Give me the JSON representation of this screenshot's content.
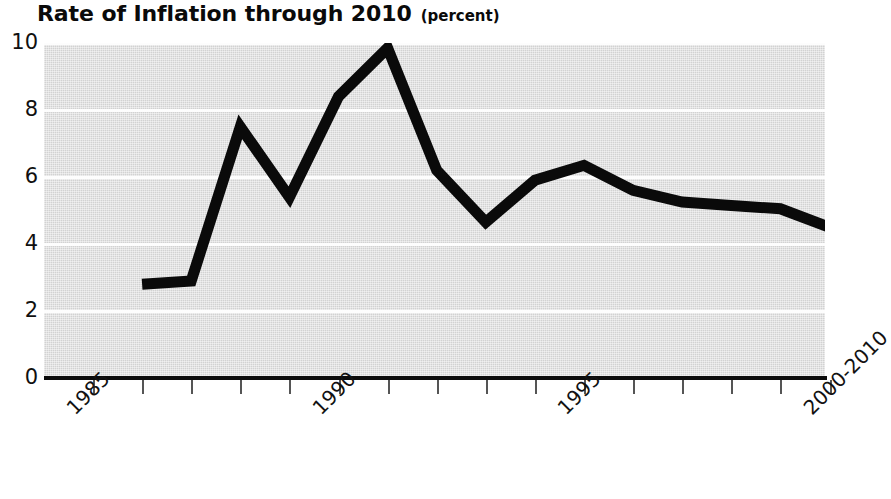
{
  "chart_data": {
    "type": "line",
    "title": "Rate of Inflation through 2010",
    "title_unit": "(percent)",
    "xlabel": "",
    "ylabel": "",
    "ylim": [
      0,
      10
    ],
    "yticks": [
      0,
      2,
      4,
      6,
      8,
      10
    ],
    "ytick_labels": [
      "0",
      "2",
      "4",
      "6",
      "8",
      "10"
    ],
    "grid": true,
    "grid_color": "#ffffff",
    "plot_background": "#d2d2d2",
    "line_color": "#0a0a0a",
    "line_width": 11,
    "legend": "none",
    "xtick_labels": [
      "1985",
      "1990",
      "1995",
      "2000-2010"
    ],
    "x": [
      "1985",
      "1986",
      "1987",
      "1988",
      "1989",
      "1990",
      "1991",
      "1992",
      "1993",
      "1994",
      "1995",
      "1996",
      "1997",
      "1998",
      "1999",
      "2000-2010"
    ],
    "values": [
      null,
      2.8,
      2.9,
      7.5,
      5.4,
      8.4,
      9.85,
      6.2,
      4.65,
      5.9,
      6.35,
      5.6,
      5.25,
      5.15,
      5.05,
      4.5
    ],
    "series": [
      {
        "name": "Rate of Inflation",
        "points": [
          {
            "year": "1986",
            "value": 2.8
          },
          {
            "year": "1987",
            "value": 2.9
          },
          {
            "year": "1988",
            "value": 7.5
          },
          {
            "year": "1989",
            "value": 5.4
          },
          {
            "year": "1990",
            "value": 8.4
          },
          {
            "year": "1991",
            "value": 9.85
          },
          {
            "year": "1992",
            "value": 6.2
          },
          {
            "year": "1993",
            "value": 4.65
          },
          {
            "year": "1994",
            "value": 5.9
          },
          {
            "year": "1995",
            "value": 6.35
          },
          {
            "year": "1996",
            "value": 5.6
          },
          {
            "year": "1997",
            "value": 5.25
          },
          {
            "year": "1998",
            "value": 5.15
          },
          {
            "year": "1999",
            "value": 5.05
          },
          {
            "year": "2000-2010",
            "value": 4.5
          }
        ]
      }
    ]
  },
  "axis": {
    "y_labels": [
      {
        "text": "10",
        "value": 10
      },
      {
        "text": "8",
        "value": 8
      },
      {
        "text": "6",
        "value": 6
      },
      {
        "text": "4",
        "value": 4
      },
      {
        "text": "2",
        "value": 2
      },
      {
        "text": "0",
        "value": 0
      }
    ],
    "x_labels": [
      {
        "text": "1985",
        "index": 0
      },
      {
        "text": "1990",
        "index": 5
      },
      {
        "text": "1995",
        "index": 10
      },
      {
        "text": "2000-2010",
        "index": 15
      }
    ]
  }
}
